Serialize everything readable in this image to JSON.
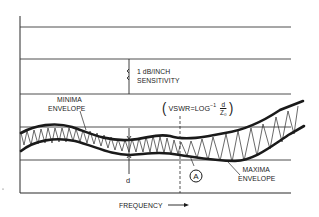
{
  "diagram": {
    "type": "vswr-sweep-plot",
    "labels": {
      "sensitivity_line1": "1 dB/INCH",
      "sensitivity_line2": "SENSITIVITY",
      "minima_line1": "MINIMA",
      "minima_line2": "ENVELOPE",
      "maxima_line1": "MAXIMA",
      "maxima_line2": "ENVELOPE",
      "d": "d",
      "point_a": "A",
      "x_axis": "FREQUENCY",
      "formula_prefix": "VSWR",
      "formula_equals": "=",
      "formula_log": "LOG",
      "formula_exp": "−1",
      "formula_numerator": "d",
      "formula_denominator": "Z₀",
      "formula_open_paren": "(",
      "formula_close_paren": ")"
    },
    "grid": {
      "horizontal_lines_y": [
        27,
        59,
        94,
        127,
        160
      ],
      "axis_left_x": 20,
      "axis_right_x": 291,
      "axis_top_y": 16,
      "axis_bottom_y": 193
    },
    "colors": {
      "ink": "#1a1a1a",
      "background": "#ffffff",
      "grid": "#3a3a3a"
    }
  }
}
